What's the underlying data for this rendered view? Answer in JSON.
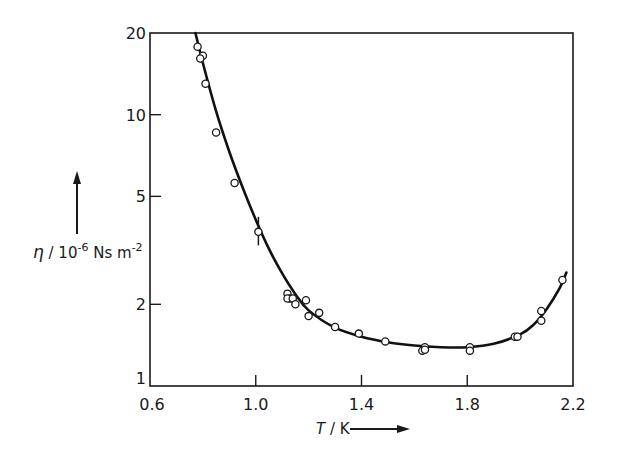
{
  "chart_data": {
    "type": "scatter",
    "title": "",
    "xlabel": "T / K",
    "ylabel": "η / 10⁻⁶ Ns m⁻²",
    "ylabel_parts": {
      "symbol": "η",
      "slash": " / 10",
      "exp1": "-6",
      "unit": " Ns m",
      "exp2": "-2"
    },
    "xlabel_parts": {
      "symbol": "T",
      "unit": " / K"
    },
    "xlim": [
      0.6,
      2.2
    ],
    "ylim": [
      1,
      20
    ],
    "yscale": "log",
    "grid": false,
    "legend": null,
    "x_ticks": [
      0.6,
      1.0,
      1.4,
      1.8,
      2.2
    ],
    "x_tick_labels": [
      "0.6",
      "1.0",
      "1.4",
      "1.8",
      "2.2"
    ],
    "y_ticks": [
      1,
      2,
      5,
      10,
      20
    ],
    "y_tick_labels": [
      "1",
      "2",
      "5",
      "10",
      "20"
    ],
    "series": [
      {
        "name": "measured",
        "marker": "open-circle",
        "points": [
          {
            "x": 0.78,
            "y": 17.8
          },
          {
            "x": 0.8,
            "y": 16.5
          },
          {
            "x": 0.79,
            "y": 16.1
          },
          {
            "x": 0.81,
            "y": 13.0
          },
          {
            "x": 0.85,
            "y": 8.6
          },
          {
            "x": 0.92,
            "y": 5.6
          },
          {
            "x": 1.01,
            "y": 3.7,
            "error": [
              3.3,
              4.2
            ]
          },
          {
            "x": 1.12,
            "y": 2.19
          },
          {
            "x": 1.13,
            "y": 2.1
          },
          {
            "x": 1.12,
            "y": 2.1
          },
          {
            "x": 1.14,
            "y": 2.1
          },
          {
            "x": 1.15,
            "y": 2.0
          },
          {
            "x": 1.19,
            "y": 2.07
          },
          {
            "x": 1.2,
            "y": 1.81
          },
          {
            "x": 1.24,
            "y": 1.86
          },
          {
            "x": 1.3,
            "y": 1.65
          },
          {
            "x": 1.39,
            "y": 1.56
          },
          {
            "x": 1.49,
            "y": 1.46
          },
          {
            "x": 1.64,
            "y": 1.39
          },
          {
            "x": 1.63,
            "y": 1.35
          },
          {
            "x": 1.64,
            "y": 1.36
          },
          {
            "x": 1.81,
            "y": 1.39
          },
          {
            "x": 1.81,
            "y": 1.35
          },
          {
            "x": 1.98,
            "y": 1.52
          },
          {
            "x": 1.99,
            "y": 1.52
          },
          {
            "x": 2.08,
            "y": 1.89
          },
          {
            "x": 2.08,
            "y": 1.74
          },
          {
            "x": 2.16,
            "y": 2.46
          }
        ]
      },
      {
        "name": "fit",
        "style": "line",
        "points": [
          {
            "x": 0.772,
            "y": 20.0
          },
          {
            "x": 0.8,
            "y": 15.5
          },
          {
            "x": 0.85,
            "y": 10.3
          },
          {
            "x": 0.9,
            "y": 7.3
          },
          {
            "x": 0.95,
            "y": 5.4
          },
          {
            "x": 1.0,
            "y": 4.1
          },
          {
            "x": 1.05,
            "y": 3.2
          },
          {
            "x": 1.1,
            "y": 2.6
          },
          {
            "x": 1.15,
            "y": 2.18
          },
          {
            "x": 1.2,
            "y": 1.9
          },
          {
            "x": 1.3,
            "y": 1.64
          },
          {
            "x": 1.4,
            "y": 1.52
          },
          {
            "x": 1.5,
            "y": 1.45
          },
          {
            "x": 1.6,
            "y": 1.41
          },
          {
            "x": 1.7,
            "y": 1.39
          },
          {
            "x": 1.8,
            "y": 1.39
          },
          {
            "x": 1.9,
            "y": 1.43
          },
          {
            "x": 2.0,
            "y": 1.55
          },
          {
            "x": 2.05,
            "y": 1.68
          },
          {
            "x": 2.1,
            "y": 1.92
          },
          {
            "x": 2.15,
            "y": 2.3
          },
          {
            "x": 2.175,
            "y": 2.62
          }
        ]
      }
    ]
  }
}
